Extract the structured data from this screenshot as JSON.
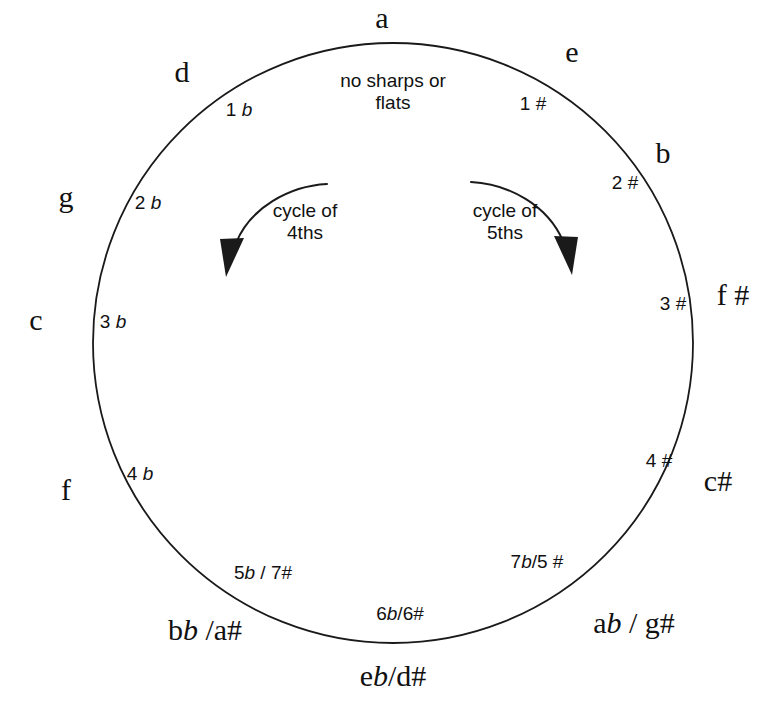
{
  "diagram": {
    "center_note": "no sharps or\nflats",
    "stroke_color": "#1a1a1a",
    "background": "#ffffff",
    "circle": {
      "cx": 393,
      "cy": 343,
      "r": 300
    }
  },
  "arrows": [
    {
      "name": "cycle-of-fourths",
      "label": "cycle of\n4ths",
      "direction": "counterclockwise-down-left",
      "label_x": 305,
      "label_y": 222
    },
    {
      "name": "cycle-of-fifths",
      "label": "cycle of\n5ths",
      "direction": "clockwise-down-right",
      "label_x": 505,
      "label_y": 222
    }
  ],
  "outer_keys": [
    {
      "name": "key-a",
      "text": "a",
      "x": 382,
      "y": 18,
      "html": "a"
    },
    {
      "name": "key-e",
      "text": "e",
      "x": 572,
      "y": 52,
      "html": "e"
    },
    {
      "name": "key-b",
      "text": "b",
      "x": 663,
      "y": 153,
      "html": "b"
    },
    {
      "name": "key-f-sharp",
      "text": "f #",
      "x": 733,
      "y": 295,
      "html": "f #"
    },
    {
      "name": "key-c-sharp",
      "text": "c#",
      "x": 718,
      "y": 481,
      "html": "c#"
    },
    {
      "name": "key-a-flat-g-sharp",
      "text": "ab / g#",
      "x": 634,
      "y": 623,
      "html": "a<i class=\"flat\">b</i> / g#"
    },
    {
      "name": "key-e-flat-d-sharp",
      "text": "eb/d#",
      "x": 393,
      "y": 676,
      "html": "e<i class=\"flat\">b</i>/d#"
    },
    {
      "name": "key-b-flat-a-sharp",
      "text": "bb /a#",
      "x": 205,
      "y": 630,
      "html": "b<i class=\"flat\">b</i> /a#"
    },
    {
      "name": "key-f",
      "text": "f",
      "x": 66,
      "y": 490,
      "html": "f"
    },
    {
      "name": "key-c",
      "text": "c",
      "x": 36,
      "y": 320,
      "html": "c"
    },
    {
      "name": "key-g",
      "text": "g",
      "x": 66,
      "y": 197,
      "html": "g"
    },
    {
      "name": "key-d",
      "text": "d",
      "x": 182,
      "y": 72,
      "html": "d"
    }
  ],
  "inner_signatures": [
    {
      "name": "sig-1-flat",
      "text": "1 b",
      "x": 239,
      "y": 109,
      "html": "1 <i class=\"flat\">b</i>"
    },
    {
      "name": "sig-2-flat",
      "text": "2 b",
      "x": 148,
      "y": 202,
      "html": "2 <i class=\"flat\">b</i>"
    },
    {
      "name": "sig-3-flat",
      "text": "3 b",
      "x": 113,
      "y": 321,
      "html": "3 <i class=\"flat\">b</i>"
    },
    {
      "name": "sig-4-flat",
      "text": "4 b",
      "x": 140,
      "y": 473,
      "html": "4 <i class=\"flat\">b</i>"
    },
    {
      "name": "sig-5-flat-7-sharp",
      "text": "5b / 7#",
      "x": 263,
      "y": 572,
      "html": "5<i class=\"flat\">b</i> / 7#"
    },
    {
      "name": "sig-6-flat-6-sharp",
      "text": "6b/6#",
      "x": 400,
      "y": 613,
      "html": "6<i class=\"flat\">b</i>/6#"
    },
    {
      "name": "sig-7-flat-5-sharp",
      "text": "7b/5 #",
      "x": 537,
      "y": 561,
      "html": "7<i class=\"flat\">b</i>/5 #"
    },
    {
      "name": "sig-4-sharp",
      "text": "4 #",
      "x": 659,
      "y": 460,
      "html": "4 #"
    },
    {
      "name": "sig-3-sharp",
      "text": "3 #",
      "x": 673,
      "y": 303,
      "html": "3 #"
    },
    {
      "name": "sig-2-sharp",
      "text": "2 #",
      "x": 625,
      "y": 182,
      "html": "2 #"
    },
    {
      "name": "sig-1-sharp",
      "text": "1 #",
      "x": 533,
      "y": 103,
      "html": "1 #"
    }
  ]
}
